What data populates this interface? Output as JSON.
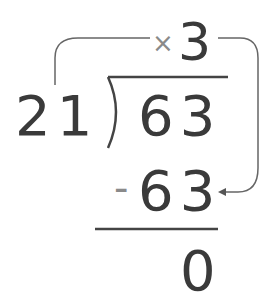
{
  "diagram": {
    "quotient_operator": "×",
    "quotient": "3",
    "divisor": "21",
    "dividend": "63",
    "subtract_operator": "-",
    "product": "63",
    "remainder": "0",
    "colors": {
      "digits": "#3a3a3a",
      "operators": "#8a8a8a",
      "lines": "#555555"
    }
  }
}
